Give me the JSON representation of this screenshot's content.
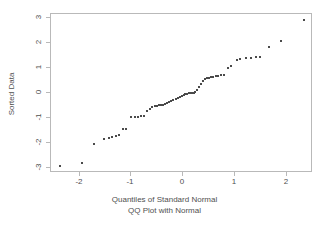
{
  "chart_data": {
    "type": "scatter",
    "title": "QQ Plot with Normal",
    "subtitle": "QQ Plot with Normal",
    "xlabel": "Quantiles of Standard Normal",
    "ylabel": "Sorted Data",
    "xlim": [
      -2.55,
      2.5
    ],
    "ylim": [
      -3.2,
      3.15
    ],
    "xticks": [
      -2,
      -1,
      0,
      1,
      2
    ],
    "xtick_labels": [
      "-2",
      "-1",
      "0",
      "1",
      "2"
    ],
    "yticks": [
      3,
      2,
      1,
      0,
      -1,
      -2,
      -3
    ],
    "ytick_labels": [
      "3",
      "2",
      "1",
      "0",
      "-1",
      "-2",
      "-3"
    ],
    "grid": false,
    "legend": null,
    "marker": "point",
    "marker_color": "#4a4a4a",
    "frame_color": "#b9b9b9",
    "background": "#ffffff",
    "n_points": 62,
    "points": [
      [
        -2.35,
        -2.95
      ],
      [
        -1.93,
        -2.85
      ],
      [
        -1.7,
        -2.08
      ],
      [
        -1.5,
        -1.9
      ],
      [
        -1.42,
        -1.85
      ],
      [
        -1.35,
        -1.82
      ],
      [
        -1.27,
        -1.75
      ],
      [
        -1.22,
        -1.72
      ],
      [
        -1.15,
        -1.5
      ],
      [
        -1.08,
        -1.47
      ],
      [
        -0.98,
        -1.02
      ],
      [
        -0.92,
        -1.01
      ],
      [
        -0.86,
        -0.99
      ],
      [
        -0.8,
        -0.97
      ],
      [
        -0.74,
        -0.95
      ],
      [
        -0.68,
        -0.78
      ],
      [
        -0.63,
        -0.7
      ],
      [
        -0.58,
        -0.62
      ],
      [
        -0.53,
        -0.58
      ],
      [
        -0.49,
        -0.55
      ],
      [
        -0.45,
        -0.54
      ],
      [
        -0.41,
        -0.53
      ],
      [
        -0.37,
        -0.52
      ],
      [
        -0.33,
        -0.5
      ],
      [
        -0.29,
        -0.45
      ],
      [
        -0.25,
        -0.4
      ],
      [
        -0.21,
        -0.35
      ],
      [
        -0.17,
        -0.31
      ],
      [
        -0.13,
        -0.28
      ],
      [
        -0.09,
        -0.24
      ],
      [
        -0.05,
        -0.2
      ],
      [
        -0.01,
        -0.16
      ],
      [
        0.03,
        -0.12
      ],
      [
        0.06,
        -0.1
      ],
      [
        0.1,
        -0.08
      ],
      [
        0.13,
        -0.06
      ],
      [
        0.16,
        -0.05
      ],
      [
        0.19,
        -0.04
      ],
      [
        0.22,
        -0.03
      ],
      [
        0.25,
        -0.02
      ],
      [
        0.28,
        0.08
      ],
      [
        0.32,
        0.18
      ],
      [
        0.36,
        0.3
      ],
      [
        0.4,
        0.45
      ],
      [
        0.44,
        0.52
      ],
      [
        0.48,
        0.55
      ],
      [
        0.52,
        0.57
      ],
      [
        0.56,
        0.59
      ],
      [
        0.6,
        0.6
      ],
      [
        0.64,
        0.62
      ],
      [
        0.69,
        0.64
      ],
      [
        0.74,
        0.66
      ],
      [
        0.8,
        0.67
      ],
      [
        0.88,
        0.95
      ],
      [
        0.93,
        1.02
      ],
      [
        1.05,
        1.28
      ],
      [
        1.12,
        1.32
      ],
      [
        1.22,
        1.35
      ],
      [
        1.32,
        1.36
      ],
      [
        1.42,
        1.38
      ],
      [
        1.5,
        1.4
      ],
      [
        1.67,
        1.78
      ],
      [
        1.9,
        2.05
      ],
      [
        2.35,
        2.87
      ]
    ]
  }
}
